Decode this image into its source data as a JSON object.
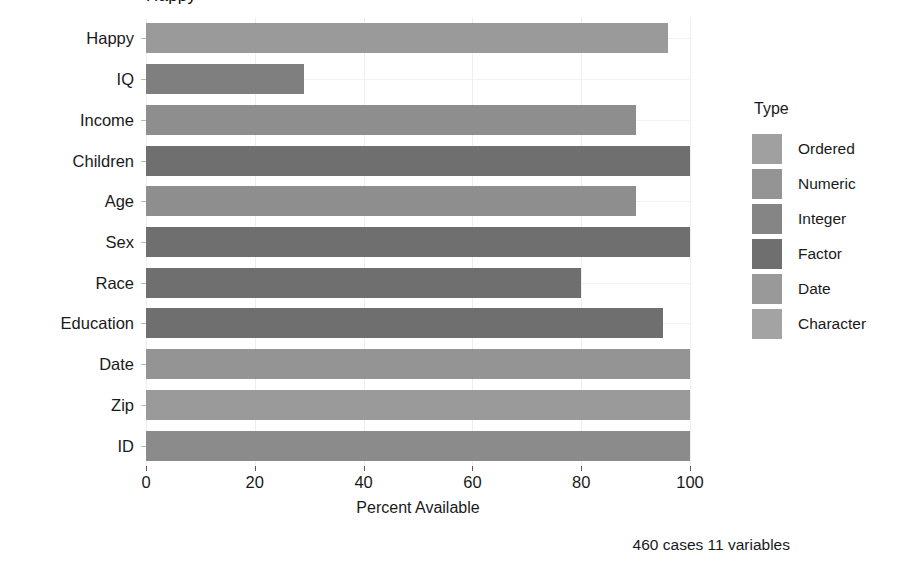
{
  "chart_data": {
    "type": "bar",
    "orientation": "horizontal",
    "title": "Happy",
    "xlabel": "Percent Available",
    "ylabel": "",
    "xlim": [
      0,
      100
    ],
    "xticks": [
      0,
      20,
      40,
      60,
      80,
      100
    ],
    "grid": true,
    "categories": [
      "Happy",
      "IQ",
      "Income",
      "Children",
      "Age",
      "Sex",
      "Race",
      "Education",
      "Date",
      "Zip",
      "ID"
    ],
    "values": [
      96,
      29,
      90,
      100,
      90,
      100,
      80,
      95,
      100,
      100,
      100
    ],
    "bar_types": [
      "Ordered",
      "Integer",
      "Numeric",
      "Factor",
      "Numeric",
      "Factor",
      "Factor",
      "Factor",
      "Date",
      "Character",
      "Integer"
    ],
    "bar_colors": [
      "#9a9a9a",
      "#7f7f7f",
      "#8e8e8e",
      "#6f6f6f",
      "#8e8e8e",
      "#6f6f6f",
      "#6f6f6f",
      "#6f6f6f",
      "#949494",
      "#9a9a9a",
      "#8b8b8b"
    ],
    "caption": "460 cases 11 variables",
    "legend": {
      "title": "Type",
      "position": "right",
      "entries": [
        {
          "label": "Ordered",
          "color": "#a0a0a0"
        },
        {
          "label": "Numeric",
          "color": "#949494"
        },
        {
          "label": "Integer",
          "color": "#858585"
        },
        {
          "label": "Factor",
          "color": "#6f6f6f"
        },
        {
          "label": "Date",
          "color": "#999999"
        },
        {
          "label": "Character",
          "color": "#a3a3a3"
        }
      ]
    }
  }
}
